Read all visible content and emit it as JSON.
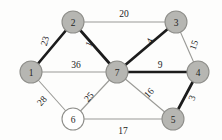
{
  "figure": {
    "kind": "weighted-undirected-graph",
    "background_color": "#fdfdfc",
    "node_fill_color": "#b6b6b2",
    "node_open_fill_color": "#ffffff",
    "node_stroke_color": "#8e8e8a",
    "thin_edge_color": "#9a9a96",
    "bold_edge_color": "#1c1c1c"
  },
  "nodes": [
    {
      "id": "1",
      "label": "1",
      "x": 31,
      "y": 72,
      "r": 11,
      "style": "filled"
    },
    {
      "id": "2",
      "label": "2",
      "x": 73,
      "y": 22,
      "r": 11,
      "style": "filled"
    },
    {
      "id": "3",
      "label": "3",
      "x": 176,
      "y": 22,
      "r": 11,
      "style": "filled"
    },
    {
      "id": "4",
      "label": "4",
      "x": 198,
      "y": 72,
      "r": 11,
      "style": "filled"
    },
    {
      "id": "5",
      "label": "5",
      "x": 173,
      "y": 119,
      "r": 11,
      "style": "filled"
    },
    {
      "id": "6",
      "label": "6",
      "x": 73,
      "y": 119,
      "r": 11,
      "style": "open"
    },
    {
      "id": "7",
      "label": "7",
      "x": 117,
      "y": 72,
      "r": 11,
      "style": "filled"
    }
  ],
  "edges": [
    {
      "id": "e-1-2",
      "from": "1",
      "to": "2",
      "weight": "23",
      "style": "bold",
      "label_x": 45,
      "label_y": 41,
      "label_rotate": -72
    },
    {
      "id": "e-2-3",
      "from": "2",
      "to": "3",
      "weight": "20",
      "style": "thin",
      "label_x": 124,
      "label_y": 14,
      "label_rotate": 0
    },
    {
      "id": "e-2-7",
      "from": "2",
      "to": "7",
      "weight": "1",
      "style": "bold",
      "label_x": 89,
      "label_y": 44,
      "label_rotate": -66
    },
    {
      "id": "e-3-7",
      "from": "3",
      "to": "7",
      "weight": "4",
      "style": "bold",
      "label_x": 150,
      "label_y": 41,
      "label_rotate": -62
    },
    {
      "id": "e-3-4",
      "from": "3",
      "to": "4",
      "weight": "15",
      "style": "thin",
      "label_x": 194,
      "label_y": 45,
      "label_rotate": -70
    },
    {
      "id": "e-1-7",
      "from": "1",
      "to": "7",
      "weight": "36",
      "style": "thin",
      "label_x": 76,
      "label_y": 65,
      "label_rotate": 0
    },
    {
      "id": "e-7-4",
      "from": "7",
      "to": "4",
      "weight": "9",
      "style": "bold",
      "label_x": 160,
      "label_y": 65,
      "label_rotate": 0
    },
    {
      "id": "e-4-5",
      "from": "4",
      "to": "5",
      "weight": "3",
      "style": "bold",
      "label_x": 192,
      "label_y": 98,
      "label_rotate": -68
    },
    {
      "id": "e-7-5",
      "from": "7",
      "to": "5",
      "weight": "16",
      "style": "thin",
      "label_x": 149,
      "label_y": 93,
      "label_rotate": -47
    },
    {
      "id": "e-1-6",
      "from": "1",
      "to": "6",
      "weight": "28",
      "style": "thin",
      "label_x": 42,
      "label_y": 101,
      "label_rotate": -48
    },
    {
      "id": "e-6-7",
      "from": "6",
      "to": "7",
      "weight": "25",
      "style": "thin",
      "label_x": 89,
      "label_y": 97,
      "label_rotate": -50
    },
    {
      "id": "e-6-5",
      "from": "6",
      "to": "5",
      "weight": "17",
      "style": "thin",
      "label_x": 123,
      "label_y": 131,
      "label_rotate": 0
    }
  ]
}
